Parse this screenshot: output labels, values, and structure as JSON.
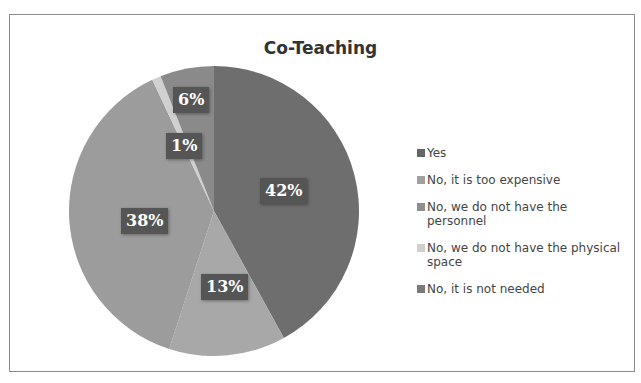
{
  "cut_header": "Page 7 of the survey: Perceptions of co-teaching arrangements",
  "chart_data": {
    "type": "pie",
    "title": "Co-Teaching",
    "categories": [
      "Yes",
      "No, it is too expensive",
      "No, we do not have the personnel",
      "No, we do not have the physical space",
      "No, it is not needed"
    ],
    "values": [
      42,
      13,
      38,
      1,
      6
    ],
    "labels": [
      "42%",
      "13%",
      "38%",
      "1%",
      "6%"
    ],
    "colors": [
      "#6e6e6e",
      "#a8a8a8",
      "#9c9c9c",
      "#d0d0d0",
      "#8a8a8a"
    ],
    "legend_position": "right",
    "start_angle_deg": 0,
    "direction": "clockwise"
  },
  "legend": {
    "items": [
      {
        "label": "Yes",
        "color": "#666666"
      },
      {
        "label": "No, it is too expensive",
        "color": "#a0a0a0"
      },
      {
        "label": "No, we do not have the personnel",
        "color": "#8e8e8e"
      },
      {
        "label": "No, we do not have the physical space",
        "color": "#cfcfcf"
      },
      {
        "label": "No, it is not needed",
        "color": "#7a7a7a"
      }
    ]
  }
}
